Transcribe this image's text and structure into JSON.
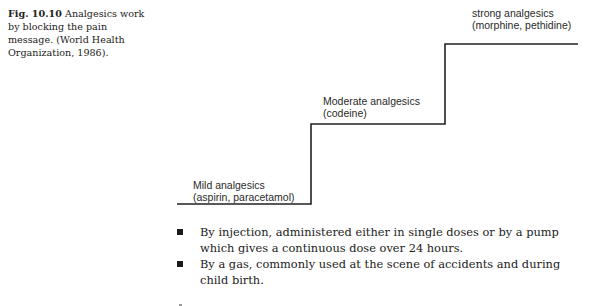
{
  "caption": {
    "figure_number": "Fig. 10.10",
    "text": "Analgesics work by blocking the pain message. (World Health Organization, 1986)."
  },
  "figure": {
    "type": "staircase-diagram",
    "line_color": "#222222",
    "steps": [
      {
        "level": 1,
        "title": "Mild analgesics",
        "examples": "(aspirin, paracetamol)"
      },
      {
        "level": 2,
        "title": "Moderate analgesics",
        "examples": "(codeine)"
      },
      {
        "level": 3,
        "title": "strong analgesics",
        "examples": "(morphine, pethidine)"
      }
    ]
  },
  "body": {
    "bullets": [
      {
        "text": "By injection, administered either in single doses or by a pump which gives a continuous dose over 24 hours."
      },
      {
        "text": "By a gas, commonly used at the scene of accidents and during child birth."
      }
    ]
  }
}
